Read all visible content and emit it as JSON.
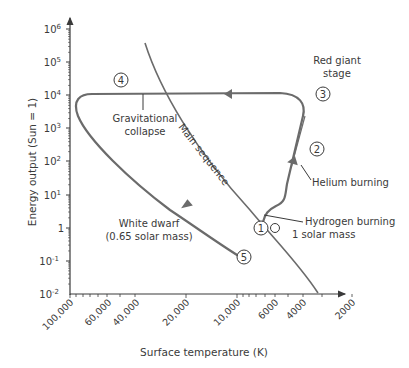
{
  "chart_data": {
    "type": "line",
    "title": "",
    "xlabel": "Surface temperature (K)",
    "ylabel": "Energy output (Sun = 1)",
    "x_axis": {
      "scale": "log",
      "reversed": true,
      "tick_labels": [
        "100,000",
        "60,000",
        "40,000",
        "20,000",
        "10,000",
        "6000",
        "4000",
        "2000"
      ]
    },
    "y_axis": {
      "scale": "log",
      "tick_labels": [
        "10^6",
        "10^5",
        "10^4",
        "10^3",
        "10^2",
        "10^1",
        "1",
        "10^-1",
        "10^-2"
      ],
      "range": [
        0.01,
        1000000
      ]
    },
    "series": [
      {
        "name": "Main sequence",
        "kind": "reference curve"
      },
      {
        "name": "Evolutionary track (1 solar mass)",
        "kind": "track",
        "stages": [
          {
            "id": 1,
            "label": "Hydrogen burning",
            "temperature_K": 5800,
            "energy": 1
          },
          {
            "id": 2,
            "label": "Helium burning",
            "temperature_K": 4500,
            "energy": 100
          },
          {
            "id": 3,
            "label": "Red giant stage",
            "temperature_K": 4000,
            "energy": 10000
          },
          {
            "id": 4,
            "label": "Gravitational collapse",
            "temperature_K": 80000,
            "energy": 10000
          },
          {
            "id": 5,
            "label": "White dwarf (0.65 solar mass)",
            "temperature_K": 8000,
            "energy": 0.15
          }
        ]
      }
    ],
    "grid": false,
    "legend": "none"
  },
  "labels": {
    "y_title": "Energy output (Sun = 1)",
    "x_title": "Surface temperature (K)",
    "y_ticks": [
      {
        "base": "10",
        "exp": "6"
      },
      {
        "base": "10",
        "exp": "5"
      },
      {
        "base": "10",
        "exp": "4"
      },
      {
        "base": "10",
        "exp": "3"
      },
      {
        "base": "10",
        "exp": "2"
      },
      {
        "base": "10",
        "exp": "1"
      },
      {
        "base": "1",
        "exp": ""
      },
      {
        "base": "10",
        "exp": "-1"
      },
      {
        "base": "10",
        "exp": "-2"
      }
    ],
    "x_ticks": [
      "100,000",
      "60,000",
      "40,000",
      "20,000",
      "10,000",
      "6000",
      "4000",
      "2000"
    ],
    "red_giant_1": "Red giant",
    "red_giant_2": "stage",
    "gravitational_1": "Gravitational",
    "gravitational_2": "collapse",
    "main_sequence": "Main sequence",
    "helium": "Helium burning",
    "hydrogen": "Hydrogen burning",
    "solar_mass": "1 solar mass",
    "white_dwarf_1": "White dwarf",
    "white_dwarf_2": "(0.65 solar mass)",
    "stage_numbers": [
      "1",
      "2",
      "3",
      "4",
      "5"
    ]
  },
  "colors": {
    "curve": "#6b6b6b",
    "axis": "#3a3a3a",
    "text": "#3a3a3a"
  }
}
